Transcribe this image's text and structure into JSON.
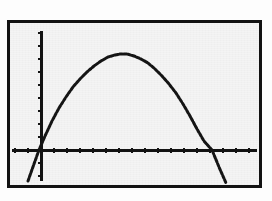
{
  "image": {
    "kind": "graphing-calculator-plot",
    "width": 272,
    "height": 201,
    "background_color": "#fdfdfd"
  },
  "frame": {
    "name": "calculator-screen",
    "x": 7,
    "y": 20,
    "width": 255,
    "height": 168,
    "border_color": "#121212",
    "border_width": 3,
    "screen_color": "#f4f4f4"
  },
  "chart_data": {
    "type": "line",
    "title": "",
    "subtitle": "",
    "xlabel": "",
    "ylabel": "",
    "legend": [],
    "legend_position": "none",
    "grid": false,
    "curve_color": "#151515",
    "axis_color": "#131313",
    "axes": {
      "x_axis": {
        "pixel_y": 150,
        "pixel_x_start": 12,
        "pixel_x_end": 257,
        "tick_spacing_px": 13,
        "tick_length_px": 5,
        "tick_count": 19,
        "labels_shown": false
      },
      "y_axis": {
        "pixel_x": 41,
        "pixel_y_start": 31,
        "pixel_y_end": 181,
        "tick_spacing_px": 13,
        "tick_length_px": 5,
        "tick_count": 11,
        "labels_shown": false
      },
      "origin_px": {
        "x": 41,
        "y": 150
      }
    },
    "curve": {
      "shape": "parabola",
      "opens": "down",
      "vertex_px": {
        "x": 120,
        "y": 54
      },
      "x_intercepts_px": [
        {
          "x": 39,
          "y": 150
        },
        {
          "x": 212,
          "y": 150
        }
      ],
      "y_intercept_px": {
        "x": 41,
        "y": 146
      },
      "left_endpoint_px": {
        "x": 28,
        "y": 181
      },
      "right_endpoint_px": {
        "x": 226,
        "y": 183
      },
      "stroke_width": 3,
      "render_style": "dotted-pixelated",
      "x_px": [
        28,
        34,
        39,
        45,
        52,
        59,
        66,
        73,
        80,
        87,
        94,
        101,
        108,
        115,
        120,
        127,
        134,
        141,
        148,
        155,
        162,
        169,
        176,
        183,
        190,
        197,
        204,
        212,
        219,
        226
      ],
      "y_px": [
        181,
        164,
        150,
        136,
        121,
        108,
        97,
        87,
        79,
        72,
        66,
        61,
        57,
        55,
        54,
        54,
        56,
        59,
        63,
        69,
        76,
        84,
        93,
        104,
        116,
        129,
        141,
        150,
        167,
        183
      ]
    }
  }
}
